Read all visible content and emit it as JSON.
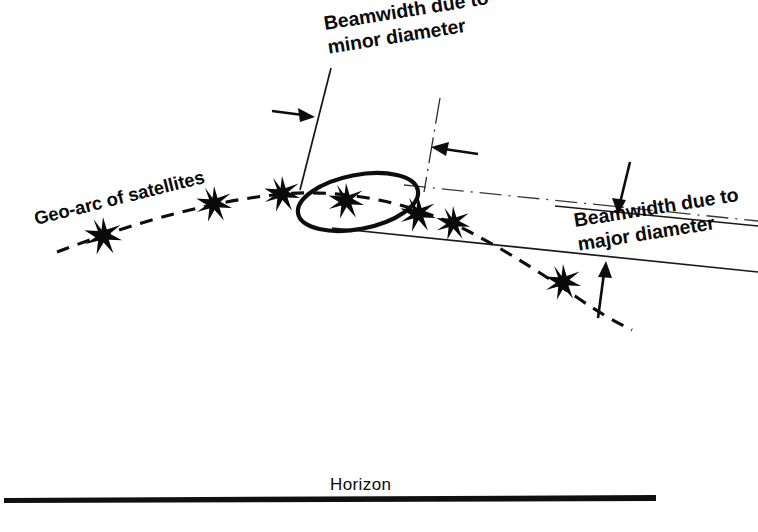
{
  "figure": {
    "title_semantic": "satellite-geo-arc-beamwidth-diagram",
    "background_color": "#ffffff",
    "ink_color": "#0d0d0d",
    "width": 758,
    "height": 532
  },
  "labels": {
    "beamwidth_minor": "Beamwidth due to\nminor diameter",
    "beamwidth_minor_line1": "Beamwidth due to",
    "beamwidth_minor_line2": "minor diameter",
    "beamwidth_major_line1": "Beamwidth due to",
    "beamwidth_major_line2": "major diameter",
    "geo_arc": "Geo-arc of satellites",
    "horizon": "Horizon"
  },
  "elements": {
    "geo_arc_path": "dashed-curve-of-satellites",
    "footprint_ellipse": "antenna-beam-footprint-ellipse",
    "beam_upper_boundary": "upper-beam-edge-line",
    "beam_lower_boundary": "lower-beam-edge-line",
    "horizon_line": "horizon-baseline"
  },
  "satellites": [
    {
      "id": "satellite-1",
      "cx": 103,
      "cy": 236,
      "r": 19
    },
    {
      "id": "satellite-2",
      "cx": 214,
      "cy": 204,
      "r": 18
    },
    {
      "id": "satellite-3",
      "cx": 282,
      "cy": 194,
      "r": 18
    },
    {
      "id": "satellite-4",
      "cx": 346,
      "cy": 201,
      "r": 18
    },
    {
      "id": "satellite-5",
      "cx": 418,
      "cy": 214,
      "r": 18
    },
    {
      "id": "satellite-6",
      "cx": 453,
      "cy": 223,
      "r": 17
    },
    {
      "id": "satellite-7",
      "cx": 563,
      "cy": 282,
      "r": 18
    }
  ],
  "annotations": {
    "arrow_minor_left": "arrow-pointing-right-to-left-beam-edge",
    "arrow_minor_right": "arrow-pointing-left-to-right-beam-edge",
    "arrow_major_top": "arrow-pointing-down-to-upper-beam-edge",
    "arrow_major_bottom": "arrow-pointing-up-to-lower-beam-edge"
  },
  "geometry": {
    "ellipse": {
      "cx": 358,
      "cy": 202,
      "rx": 61,
      "ry": 27,
      "rotation_deg": -11
    },
    "label_rotations": {
      "beamwidth_minor_deg": -9,
      "beamwidth_major_deg": -9,
      "geo_arc_deg": -14
    },
    "horizon_line_y": 500,
    "horizon_line_x_start": 4,
    "horizon_line_x_end": 656
  }
}
